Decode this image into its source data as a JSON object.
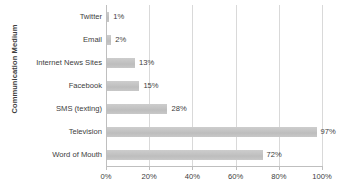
{
  "chart_data": {
    "type": "bar",
    "orientation": "horizontal",
    "title": "",
    "xlabel": "",
    "ylabel": "Communication Medium",
    "categories": [
      "Twitter",
      "Email",
      "Internet News Sites",
      "Facebook",
      "SMS (texting)",
      "Television",
      "Word of Mouth"
    ],
    "values": [
      1,
      2,
      13,
      15,
      28,
      97,
      72
    ],
    "data_labels": [
      "1%",
      "2%",
      "13%",
      "15%",
      "28%",
      "97%",
      "72%"
    ],
    "xlim": [
      0,
      100
    ],
    "x_ticks": [
      0,
      20,
      40,
      60,
      80,
      100
    ],
    "x_tick_labels": [
      "0%",
      "20%",
      "40%",
      "60%",
      "80%",
      "100%"
    ],
    "grid": "vertical",
    "legend": "none",
    "bar_color": "#c3c3c3",
    "text_color": "#3d3d3d",
    "gridline_color": "#d9d9d9"
  }
}
